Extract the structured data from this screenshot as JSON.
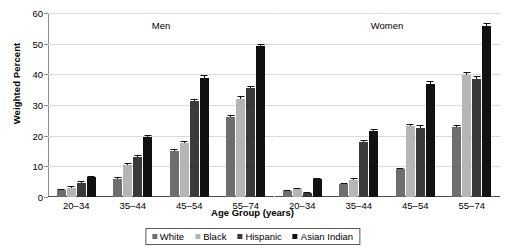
{
  "chart_data": {
    "type": "bar",
    "title": "",
    "xlabel": "Age Group (years)",
    "ylabel": "Weighted Percent",
    "ylim": [
      0,
      60
    ],
    "yticks": [
      0,
      10,
      20,
      30,
      40,
      50,
      60
    ],
    "grid": true,
    "legend_position": "bottom",
    "categories": [
      "20–34",
      "35–44",
      "45–54",
      "55–74"
    ],
    "panels": [
      {
        "name": "Men",
        "series": [
          {
            "name": "White",
            "values": [
              2.2,
              6.0,
              15.0,
              26.0
            ],
            "errors": [
              0.4,
              0.5,
              0.6,
              0.9
            ]
          },
          {
            "name": "Black",
            "values": [
              3.0,
              10.5,
              17.5,
              31.8
            ],
            "errors": [
              0.5,
              0.7,
              0.8,
              1.0
            ]
          },
          {
            "name": "Hispanic",
            "values": [
              4.6,
              13.2,
              31.2,
              35.4
            ],
            "errors": [
              0.5,
              0.6,
              0.8,
              0.9
            ]
          },
          {
            "name": "Asian Indian",
            "values": [
              6.4,
              19.5,
              38.9,
              49.2
            ],
            "errors": [
              0.5,
              0.7,
              1.0,
              0.8
            ]
          }
        ]
      },
      {
        "name": "Women",
        "series": [
          {
            "name": "White",
            "values": [
              1.8,
              4.2,
              9.0,
              22.8
            ],
            "errors": [
              0.4,
              0.5,
              0.6,
              0.8
            ]
          },
          {
            "name": "Black",
            "values": [
              2.6,
              5.6,
              23.0,
              39.8
            ],
            "errors": [
              0.4,
              0.5,
              0.8,
              0.9
            ]
          },
          {
            "name": "Hispanic",
            "values": [
              1.2,
              18.0,
              22.6,
              38.6
            ],
            "errors": [
              0.4,
              0.7,
              0.8,
              0.9
            ]
          },
          {
            "name": "Asian Indian",
            "values": [
              5.8,
              21.6,
              36.8,
              55.8
            ],
            "errors": [
              0.5,
              0.7,
              0.9,
              1.0
            ]
          }
        ]
      }
    ],
    "series_colors": [
      "#6e6e6e",
      "#b5b5b5",
      "#3a3a3a",
      "#111111"
    ],
    "legend": [
      "White",
      "Black",
      "Hispanic",
      "Asian Indian"
    ]
  }
}
